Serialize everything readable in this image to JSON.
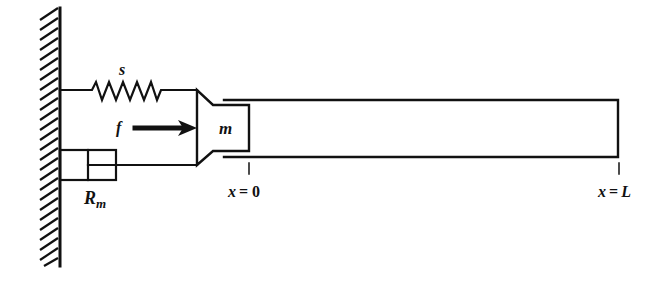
{
  "diagram": {
    "type": "mechanical-schematic",
    "colors": {
      "ink": "#111111",
      "background": "#ffffff"
    },
    "labels": {
      "spring": "s",
      "force": "f",
      "mass": "m",
      "damper": "R",
      "damper_sub": "m",
      "x0_var": "x",
      "x0_eq": "= 0",
      "xL_var": "x",
      "xL_eq": "=",
      "xL_val": "L"
    },
    "components": [
      {
        "id": "wall",
        "kind": "fixed-wall-hatched"
      },
      {
        "id": "spring",
        "kind": "spring",
        "label": "s"
      },
      {
        "id": "damper",
        "kind": "dashpot",
        "label": "Rm"
      },
      {
        "id": "force",
        "kind": "arrow",
        "label": "f",
        "direction": "right"
      },
      {
        "id": "mass",
        "kind": "piston-mass",
        "label": "m"
      },
      {
        "id": "tube",
        "kind": "tube",
        "from": "x = 0",
        "to": "x = L"
      }
    ]
  }
}
